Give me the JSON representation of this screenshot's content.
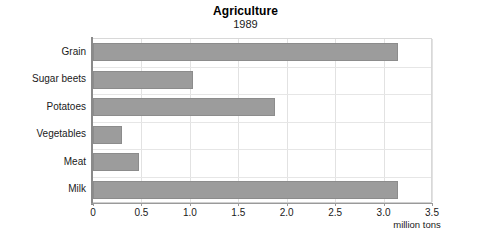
{
  "chart_data": {
    "type": "bar",
    "orientation": "horizontal",
    "title": "Agriculture",
    "subtitle": "1989",
    "categories": [
      "Grain",
      "Sugar beets",
      "Potatoes",
      "Vegetables",
      "Meat",
      "Milk"
    ],
    "values": [
      3.15,
      1.03,
      1.88,
      0.3,
      0.48,
      3.15
    ],
    "xlabel": "million tons",
    "ylabel": "",
    "xlim": [
      0,
      3.5
    ],
    "xticks": [
      0,
      0.5,
      1.0,
      1.5,
      2.0,
      2.5,
      3.0,
      3.5
    ],
    "xtick_labels": [
      "0",
      "0.5",
      "1.0",
      "1.5",
      "2.0",
      "2.5",
      "3.0",
      "3.5"
    ],
    "grid": true,
    "legend": false,
    "bar_color": "#9c9c9c",
    "bar_edge_color": "#8c8c8c",
    "background_color": "#ffffff",
    "gridline_color": "#e2e2e2",
    "axis_color": "#8a8a8a"
  }
}
